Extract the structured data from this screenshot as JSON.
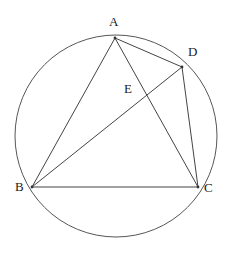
{
  "figure": {
    "background_color": "#ffffff",
    "stroke_color": "#444444",
    "circle_stroke_color": "#555555",
    "label_color": "#1a1a1a"
  },
  "circle": {
    "center_x": 116,
    "center_y": 136,
    "radius": 101
  },
  "points": [
    {
      "id": "A",
      "label": "A",
      "x": 115,
      "y": 38,
      "label_x": 109,
      "label_y": 15,
      "on_circle": true
    },
    {
      "id": "D",
      "label": "D",
      "x": 182,
      "y": 67,
      "label_x": 188,
      "label_y": 45,
      "on_circle": true
    },
    {
      "id": "E",
      "label": "E",
      "x": 145,
      "y": 96,
      "label_x": 124,
      "label_y": 82,
      "on_circle": false
    },
    {
      "id": "B",
      "label": "B",
      "x": 32,
      "y": 187,
      "label_x": 15,
      "label_y": 180,
      "on_circle": true
    },
    {
      "id": "C",
      "label": "C",
      "x": 198,
      "y": 187,
      "label_x": 204,
      "label_y": 181,
      "on_circle": true
    }
  ],
  "segments": [
    {
      "id": "AB",
      "from": "A",
      "to": "B"
    },
    {
      "id": "AC",
      "from": "A",
      "to": "C"
    },
    {
      "id": "AD",
      "from": "A",
      "to": "D"
    },
    {
      "id": "BC",
      "from": "B",
      "to": "C"
    },
    {
      "id": "BD",
      "from": "B",
      "to": "D"
    },
    {
      "id": "DC",
      "from": "D",
      "to": "C"
    }
  ]
}
